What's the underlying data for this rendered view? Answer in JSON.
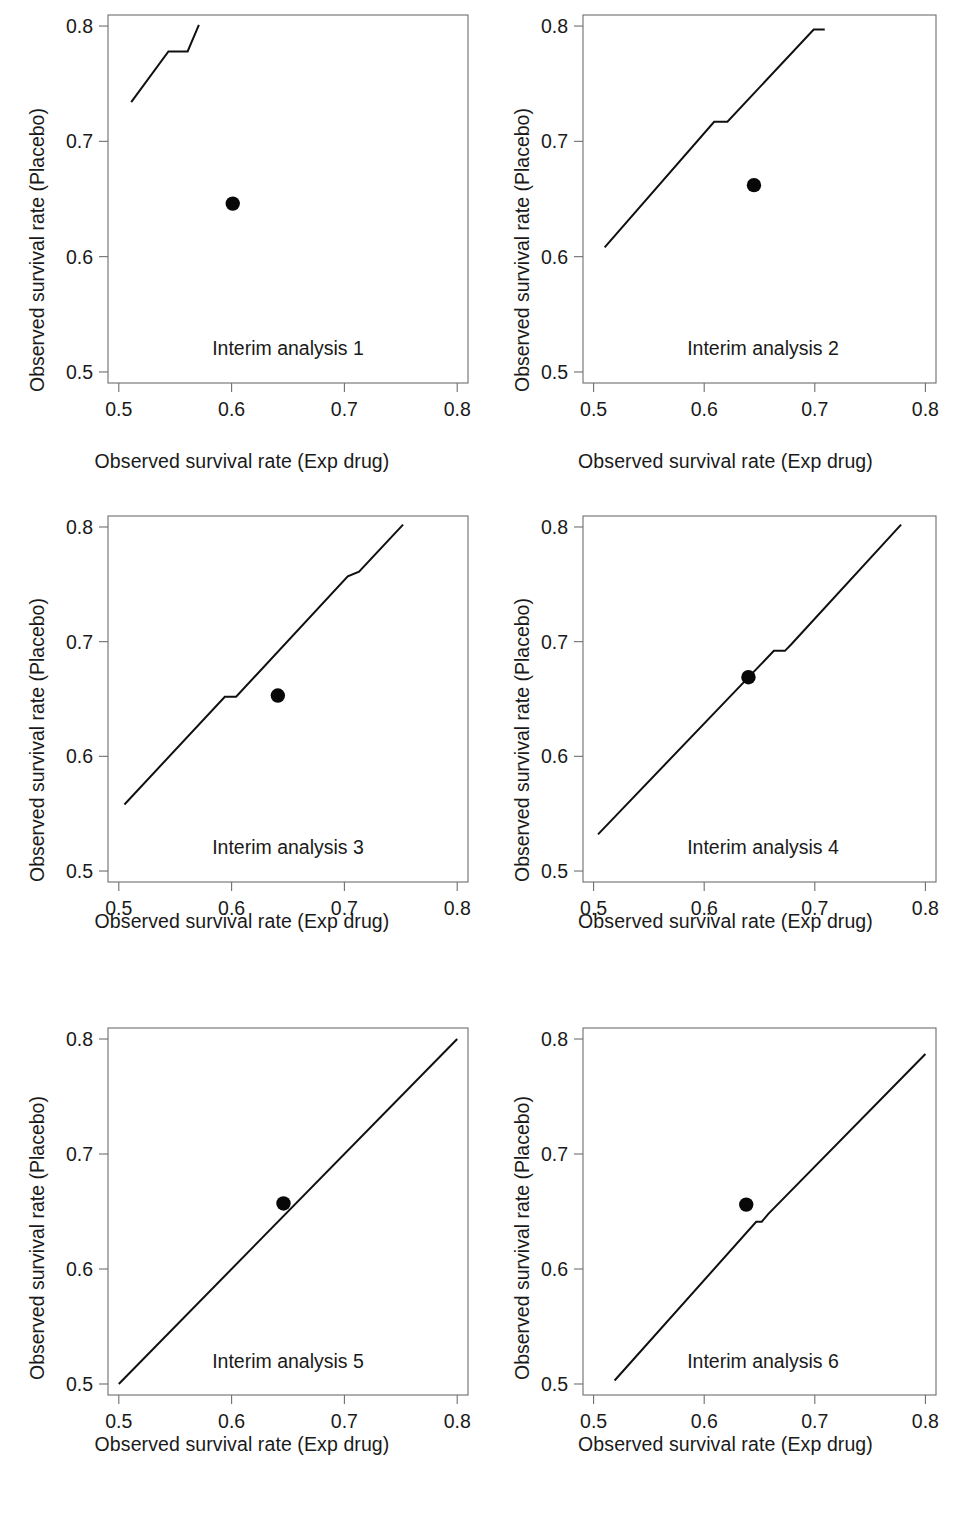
{
  "figure": {
    "type": "multi-panel-scatter",
    "panels_rows": 3,
    "panels_cols": 2,
    "axis_title_x": "Observed survival rate (Exp drug)",
    "axis_title_y": "Observed survival rate (Placebo)",
    "line_color": "#101010",
    "dot_color": "#080808",
    "frame_color": "#6e6e6e"
  },
  "axes": {
    "xticks": [
      "0.5",
      "0.6",
      "0.7",
      "0.8"
    ],
    "yticks": [
      "0.5",
      "0.6",
      "0.7",
      "0.8"
    ],
    "xlim": [
      0.5,
      0.8
    ],
    "ylim": [
      0.5,
      0.8
    ]
  },
  "chart_data": [
    {
      "type": "line",
      "title": "Interim analysis 1",
      "xlabel": "Observed survival rate (Exp drug)",
      "ylabel": "Observed survival rate (Placebo)",
      "xlim": [
        0.5,
        0.8
      ],
      "ylim": [
        0.5,
        0.8
      ],
      "xticks": [
        0.5,
        0.6,
        0.7,
        0.8
      ],
      "yticks": [
        0.5,
        0.6,
        0.7,
        0.8
      ],
      "grid": false,
      "legend": "none",
      "series": [
        {
          "name": "Stopping boundary",
          "x": [
            0.511,
            0.544,
            0.561,
            0.571
          ],
          "y": [
            0.734,
            0.778,
            0.778,
            0.801
          ]
        }
      ],
      "points": [
        {
          "name": "Observed",
          "x": 0.601,
          "y": 0.646
        }
      ]
    },
    {
      "type": "line",
      "title": "Interim analysis 2",
      "xlabel": "Observed survival rate (Exp drug)",
      "ylabel": "Observed survival rate (Placebo)",
      "xlim": [
        0.5,
        0.8
      ],
      "ylim": [
        0.5,
        0.8
      ],
      "xticks": [
        0.5,
        0.6,
        0.7,
        0.8
      ],
      "yticks": [
        0.5,
        0.6,
        0.7,
        0.8
      ],
      "grid": false,
      "legend": "none",
      "series": [
        {
          "name": "Stopping boundary",
          "x": [
            0.51,
            0.609,
            0.621,
            0.699,
            0.709
          ],
          "y": [
            0.608,
            0.717,
            0.717,
            0.797,
            0.797
          ]
        }
      ],
      "points": [
        {
          "name": "Observed",
          "x": 0.645,
          "y": 0.662
        }
      ]
    },
    {
      "type": "line",
      "title": "Interim analysis 3",
      "xlabel": "Observed survival rate (Exp drug)",
      "ylabel": "Observed survival rate (Placebo)",
      "xlim": [
        0.5,
        0.8
      ],
      "ylim": [
        0.5,
        0.8
      ],
      "xticks": [
        0.5,
        0.6,
        0.7,
        0.8
      ],
      "yticks": [
        0.5,
        0.6,
        0.7,
        0.8
      ],
      "grid": false,
      "legend": "none",
      "series": [
        {
          "name": "Stopping boundary",
          "x": [
            0.505,
            0.594,
            0.604,
            0.703,
            0.713,
            0.752
          ],
          "y": [
            0.558,
            0.652,
            0.652,
            0.757,
            0.761,
            0.802
          ]
        }
      ],
      "points": [
        {
          "name": "Observed",
          "x": 0.641,
          "y": 0.653
        }
      ]
    },
    {
      "type": "line",
      "title": "Interim analysis 4",
      "xlabel": "Observed survival rate (Exp drug)",
      "ylabel": "Observed survival rate (Placebo)",
      "xlim": [
        0.5,
        0.8
      ],
      "ylim": [
        0.5,
        0.8
      ],
      "xticks": [
        0.5,
        0.6,
        0.7,
        0.8
      ],
      "yticks": [
        0.5,
        0.6,
        0.7,
        0.8
      ],
      "grid": false,
      "legend": "none",
      "series": [
        {
          "name": "Stopping boundary",
          "x": [
            0.504,
            0.663,
            0.673,
            0.679,
            0.778
          ],
          "y": [
            0.532,
            0.692,
            0.692,
            0.698,
            0.802
          ]
        }
      ],
      "points": [
        {
          "name": "Observed",
          "x": 0.64,
          "y": 0.669
        }
      ]
    },
    {
      "type": "line",
      "title": "Interim analysis 5",
      "xlabel": "Observed survival rate (Exp drug)",
      "ylabel": "Observed survival rate (Placebo)",
      "xlim": [
        0.5,
        0.8
      ],
      "ylim": [
        0.5,
        0.8
      ],
      "xticks": [
        0.5,
        0.6,
        0.7,
        0.8
      ],
      "yticks": [
        0.5,
        0.6,
        0.7,
        0.8
      ],
      "grid": false,
      "legend": "none",
      "series": [
        {
          "name": "Stopping boundary",
          "x": [
            0.5,
            0.8
          ],
          "y": [
            0.5,
            0.8
          ]
        }
      ],
      "points": [
        {
          "name": "Observed",
          "x": 0.646,
          "y": 0.657
        }
      ]
    },
    {
      "type": "line",
      "title": "Interim analysis 6",
      "xlabel": "Observed survival rate (Exp drug)",
      "ylabel": "Observed survival rate (Placebo)",
      "xlim": [
        0.5,
        0.8
      ],
      "ylim": [
        0.5,
        0.8
      ],
      "xticks": [
        0.5,
        0.6,
        0.7,
        0.8
      ],
      "yticks": [
        0.5,
        0.6,
        0.7,
        0.8
      ],
      "grid": false,
      "legend": "none",
      "series": [
        {
          "name": "Stopping boundary",
          "x": [
            0.519,
            0.647,
            0.652,
            0.658,
            0.8
          ],
          "y": [
            0.503,
            0.641,
            0.641,
            0.648,
            0.787
          ]
        }
      ],
      "points": [
        {
          "name": "Observed",
          "x": 0.638,
          "y": 0.656
        }
      ]
    }
  ],
  "panel_labels": {
    "p1": "Interim analysis 1",
    "p2": "Interim analysis 2",
    "p3": "Interim analysis 3",
    "p4": "Interim analysis 4",
    "p5": "Interim analysis 5",
    "p6": "Interim analysis 6"
  }
}
